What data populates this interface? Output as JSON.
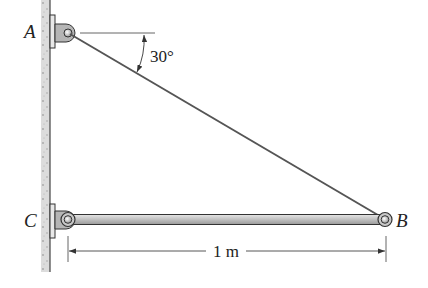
{
  "diagram": {
    "type": "statics-free-body-setup",
    "points": {
      "A": {
        "label": "A",
        "role": "wall pin support (cable anchor)"
      },
      "B": {
        "label": "B",
        "role": "end of boom / cable attachment"
      },
      "C": {
        "label": "C",
        "role": "wall pin support (boom)"
      }
    },
    "members": [
      {
        "name": "cable-AB",
        "from": "A",
        "to": "B"
      },
      {
        "name": "boom-CB",
        "from": "C",
        "to": "B"
      }
    ],
    "angle": {
      "label": "30°",
      "value_deg": 30,
      "between": "cable AB and horizontal at A"
    },
    "dimension": {
      "label": "1 m",
      "from": "C",
      "to": "B"
    },
    "colors": {
      "wall": "#d9d9d9",
      "bar": "#b8b8b8",
      "outline": "#333333",
      "line": "#555555"
    }
  }
}
